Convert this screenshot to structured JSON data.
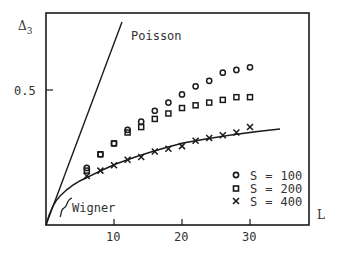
{
  "chart_data": {
    "type": "scatter",
    "title": "",
    "xlabel": "L",
    "ylabel": "Δ3",
    "xlim": [
      0,
      38
    ],
    "ylim": [
      0,
      0.78
    ],
    "grid": false,
    "legend_position": "lower right",
    "x_ticks": [
      {
        "value": 10,
        "label": "10"
      },
      {
        "value": 20,
        "label": "20"
      },
      {
        "value": 30,
        "label": "30"
      }
    ],
    "y_ticks": [
      {
        "value": 0.5,
        "label": "0.5"
      }
    ],
    "x": [
      6,
      8,
      10,
      12,
      14,
      16,
      18,
      20,
      22,
      24,
      26,
      28,
      30
    ],
    "series": [
      {
        "name": "S = 100",
        "marker": "circle",
        "values": [
          0.21,
          0.26,
          0.3,
          0.35,
          0.38,
          0.42,
          0.45,
          0.48,
          0.51,
          0.53,
          0.56,
          0.57,
          0.58
        ]
      },
      {
        "name": "S = 200",
        "marker": "square",
        "values": [
          0.2,
          0.26,
          0.3,
          0.34,
          0.36,
          0.39,
          0.41,
          0.43,
          0.44,
          0.45,
          0.46,
          0.47,
          0.47
        ]
      },
      {
        "name": "S = 400",
        "marker": "cross",
        "values": [
          0.18,
          0.2,
          0.22,
          0.24,
          0.25,
          0.27,
          0.28,
          0.29,
          0.31,
          0.32,
          0.33,
          0.34,
          0.36
        ]
      }
    ],
    "reference_curves": [
      {
        "name": "Poisson",
        "kind": "line",
        "formula": "L/15",
        "points": [
          [
            0,
            0
          ],
          [
            11.2,
            0.745
          ]
        ]
      },
      {
        "name": "Wigner",
        "kind": "curve",
        "points": [
          [
            0,
            0
          ],
          [
            1.5,
            0.09
          ],
          [
            3.5,
            0.137
          ],
          [
            5.9,
            0.173
          ],
          [
            10,
            0.224
          ],
          [
            14,
            0.26
          ],
          [
            20,
            0.3
          ],
          [
            26.2,
            0.327
          ],
          [
            30.3,
            0.342
          ],
          [
            34.4,
            0.353
          ]
        ]
      }
    ],
    "annotations": [
      {
        "text": "Poisson",
        "near": "Poisson line top"
      },
      {
        "text": "Wigner",
        "near": "Wigner curve origin"
      }
    ],
    "legend": [
      {
        "marker": "circle",
        "label_var": "S",
        "label_eq": "=",
        "label_val": "100"
      },
      {
        "marker": "square",
        "label_var": "S",
        "label_eq": "=",
        "label_val": "200"
      },
      {
        "marker": "cross",
        "label_var": "S",
        "label_eq": "=",
        "label_val": "400"
      }
    ]
  },
  "labels": {
    "y_axis": "Δ",
    "y_axis_sub": "3",
    "x_axis": "L",
    "poisson": "Poisson",
    "wigner": "Wigner",
    "tick_05": "0.5",
    "tick_10": "10",
    "tick_20": "20",
    "tick_30": "30"
  },
  "colors": {
    "ink": "#1a1a1a",
    "text": "#333333",
    "background": "#ffffff"
  }
}
